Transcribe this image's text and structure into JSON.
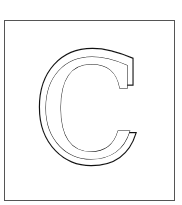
{
  "figure": {
    "letter": "C",
    "style": "outlined serif capital letter in a square frame",
    "colors": {
      "background": "#ffffff",
      "frame_border": "#555555",
      "letter_outline": "#111111",
      "letter_fill": "#ffffff"
    }
  }
}
